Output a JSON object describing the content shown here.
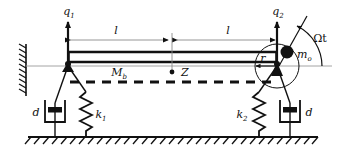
{
  "figure": {
    "kind": "mechanical-schematic",
    "background_color": "#ffffff",
    "line_color": "#111111",
    "thin_line_color": "#8a8a8a"
  },
  "labels": {
    "q1": "q",
    "q1_sub": "1",
    "q2": "q",
    "q2_sub": "2",
    "span_left": "l",
    "span_right": "l",
    "beam_mass": "M",
    "beam_mass_sub": "b",
    "center_point": "Z",
    "radius": "r",
    "unbalance_mass": "m",
    "unbalance_mass_sub": "o",
    "rotation_angle": "Ωt",
    "spring_left": "k",
    "spring_left_sub": "1",
    "spring_right": "k",
    "spring_right_sub": "2",
    "damper_left": "d",
    "damper_right": "d"
  },
  "components": {
    "wall": "fixed-wall-hatching",
    "ground": "ground-hatching",
    "beam": "rigid-beam",
    "deflected_shape": "dashed-deflected-beam",
    "left_support": "pin-node-left",
    "right_support": "pin-node-right",
    "rotor_disk": "rotor-circle",
    "eccentric_mass": "filled-mass-dot",
    "springs": [
      "k1-coil-spring",
      "k2-coil-spring"
    ],
    "dampers": [
      "left-dashpot",
      "right-dashpot"
    ]
  },
  "geometry": {
    "left_support_x": 68,
    "right_support_x": 277,
    "center_x": 172,
    "beam_top_y": 52,
    "beam_bottom_y": 63,
    "dimension_line_y": 40,
    "ground_y": 137,
    "rotor_center_x": 277,
    "rotor_center_y": 66,
    "rotor_radius": 22,
    "mass_dot_x": 285,
    "mass_dot_y": 50
  }
}
